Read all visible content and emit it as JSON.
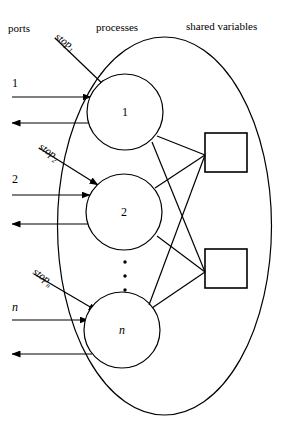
{
  "figure": {
    "headers": {
      "ports": "ports",
      "processes": "processes",
      "shared_variables": "shared variables"
    },
    "ports": [
      {
        "label": "1",
        "italic": false
      },
      {
        "label": "2",
        "italic": false
      },
      {
        "label": "n",
        "italic": true
      }
    ],
    "processes": [
      {
        "label": "1",
        "italic": false
      },
      {
        "label": "2",
        "italic": false
      },
      {
        "label": "n",
        "italic": true
      }
    ],
    "stop_signals": [
      {
        "name": "stop",
        "subscript": "1"
      },
      {
        "name": "stop",
        "subscript": "2"
      },
      {
        "name": "stop",
        "subscript": "n"
      }
    ],
    "shared_variables": [
      {
        "index": 1
      },
      {
        "index": 2
      }
    ],
    "ellipsis": "⋮",
    "colors": {
      "stroke": "#000000",
      "background": "#ffffff"
    }
  }
}
